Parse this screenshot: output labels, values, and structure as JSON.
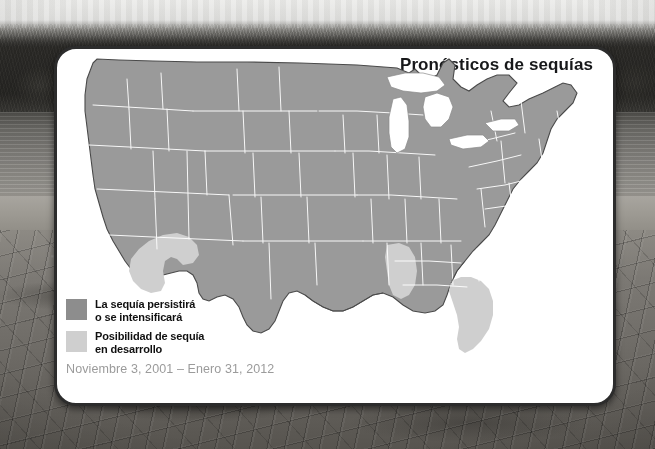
{
  "card": {
    "title": "Pronósticos de sequías"
  },
  "legend": {
    "items": [
      {
        "swatch": "dark-gray",
        "color": "#8d8d8d",
        "line1": "La sequía persistirá",
        "line2": "o se intensificará"
      },
      {
        "swatch": "light-gray",
        "color": "#cfcfcf",
        "line1": "Posibilidad de sequía",
        "line2": "en desarrollo"
      }
    ],
    "date_range": "Noviembre 3, 2001 – Enero 31, 2012"
  },
  "map": {
    "region_name": "Estados Unidos continental",
    "land_color": "#9a9a9a",
    "developing_color": "#cfcfcf",
    "border_color": "#ffffff",
    "coast_color": "#4a4a4a",
    "water_color": "#ffffff",
    "areas": [
      {
        "name": "suroeste-california-arizona",
        "category": "developing"
      },
      {
        "name": "luisiana-misisipi-costa-golfo",
        "category": "developing"
      },
      {
        "name": "florida-peninsula",
        "category": "developing"
      },
      {
        "name": "resto-del-pais",
        "category": "persist"
      }
    ]
  },
  "background": {
    "scene": "lago-seco-con-arboles",
    "sky": "#dcdcda",
    "trees": "#2a2926",
    "water": "#807e7a",
    "dry-ground": "#6e6b66"
  }
}
